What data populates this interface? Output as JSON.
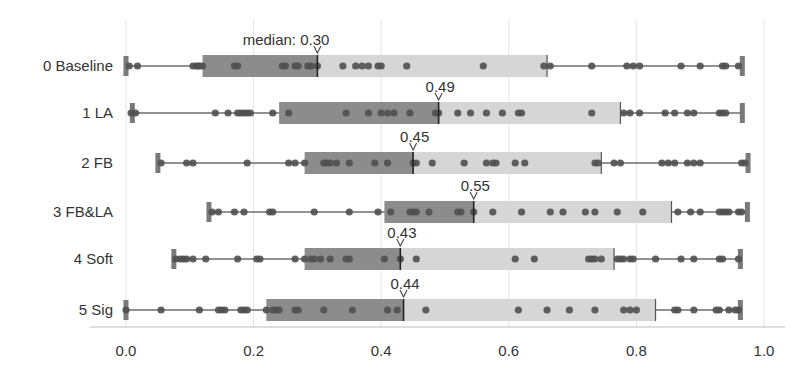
{
  "chart_data": {
    "type": "box-strip",
    "title": "",
    "xlabel": "",
    "ylabel": "",
    "xlim": [
      0.0,
      1.0
    ],
    "x_ticks": [
      "0.0",
      "0.2",
      "0.4",
      "0.6",
      "0.8",
      "1.0"
    ],
    "grid": true,
    "median_label_prefix": "median: ",
    "colors": {
      "box_lower": "#8c8c8c",
      "box_upper": "#d6d6d6",
      "whisker": "#6e6e6e",
      "dot": "#505050",
      "median_line": "#222222",
      "grid": "#e4e4e4",
      "axis": "#bbbbbb",
      "cap": "#7a7a7a"
    },
    "series": [
      {
        "name": "0 Baseline",
        "min": 0.0,
        "q1": 0.12,
        "median": 0.3,
        "q3": 0.66,
        "max": 0.966,
        "median_label": "0.30",
        "points": [
          0.005,
          0.018,
          0.105,
          0.11,
          0.113,
          0.116,
          0.12,
          0.17,
          0.175,
          0.245,
          0.25,
          0.265,
          0.27,
          0.285,
          0.29,
          0.3,
          0.34,
          0.36,
          0.37,
          0.38,
          0.395,
          0.4,
          0.44,
          0.56,
          0.655,
          0.665,
          0.73,
          0.785,
          0.795,
          0.805,
          0.87,
          0.9,
          0.935,
          0.94,
          0.96
        ]
      },
      {
        "name": "1 LA",
        "min": 0.01,
        "q1": 0.24,
        "median": 0.49,
        "q3": 0.775,
        "max": 0.966,
        "median_label": "0.49",
        "points": [
          0.008,
          0.015,
          0.14,
          0.16,
          0.175,
          0.18,
          0.185,
          0.19,
          0.195,
          0.23,
          0.255,
          0.345,
          0.38,
          0.4,
          0.41,
          0.42,
          0.445,
          0.485,
          0.49,
          0.52,
          0.54,
          0.565,
          0.59,
          0.615,
          0.62,
          0.73,
          0.78,
          0.79,
          0.805,
          0.845,
          0.86,
          0.88,
          0.89,
          0.93,
          0.935,
          0.94
        ]
      },
      {
        "name": "2 FB",
        "min": 0.05,
        "q1": 0.28,
        "median": 0.45,
        "q3": 0.745,
        "max": 0.975,
        "median_label": "0.45",
        "points": [
          0.055,
          0.095,
          0.105,
          0.19,
          0.255,
          0.265,
          0.28,
          0.31,
          0.315,
          0.32,
          0.33,
          0.35,
          0.39,
          0.41,
          0.45,
          0.455,
          0.48,
          0.53,
          0.565,
          0.575,
          0.58,
          0.61,
          0.625,
          0.735,
          0.74,
          0.765,
          0.775,
          0.84,
          0.85,
          0.86,
          0.88,
          0.89,
          0.9,
          0.965,
          0.97
        ]
      },
      {
        "name": "3 FB&LA",
        "min": 0.13,
        "q1": 0.405,
        "median": 0.545,
        "q3": 0.855,
        "max": 0.974,
        "median_label": "0.55",
        "points": [
          0.135,
          0.145,
          0.17,
          0.185,
          0.225,
          0.23,
          0.295,
          0.35,
          0.395,
          0.415,
          0.445,
          0.45,
          0.455,
          0.475,
          0.52,
          0.525,
          0.545,
          0.575,
          0.62,
          0.665,
          0.685,
          0.72,
          0.735,
          0.77,
          0.81,
          0.865,
          0.885,
          0.9,
          0.93,
          0.935,
          0.94,
          0.945,
          0.96,
          0.965
        ]
      },
      {
        "name": "4 Soft",
        "min": 0.075,
        "q1": 0.28,
        "median": 0.43,
        "q3": 0.765,
        "max": 0.963,
        "median_label": "0.43",
        "points": [
          0.078,
          0.085,
          0.09,
          0.095,
          0.105,
          0.125,
          0.175,
          0.205,
          0.21,
          0.265,
          0.28,
          0.29,
          0.295,
          0.305,
          0.32,
          0.345,
          0.35,
          0.405,
          0.43,
          0.455,
          0.61,
          0.64,
          0.725,
          0.73,
          0.735,
          0.745,
          0.77,
          0.775,
          0.78,
          0.79,
          0.795,
          0.83,
          0.87,
          0.89,
          0.93,
          0.935,
          0.96
        ]
      },
      {
        "name": "5 Sig",
        "min": 0.0,
        "q1": 0.22,
        "median": 0.435,
        "q3": 0.83,
        "max": 0.963,
        "median_label": "0.44",
        "points": [
          0.0,
          0.055,
          0.115,
          0.145,
          0.15,
          0.155,
          0.18,
          0.185,
          0.19,
          0.22,
          0.23,
          0.235,
          0.24,
          0.265,
          0.27,
          0.31,
          0.355,
          0.41,
          0.425,
          0.47,
          0.615,
          0.66,
          0.695,
          0.735,
          0.78,
          0.79,
          0.8,
          0.86,
          0.865,
          0.89,
          0.925,
          0.93,
          0.945,
          0.955,
          0.96
        ]
      }
    ]
  }
}
